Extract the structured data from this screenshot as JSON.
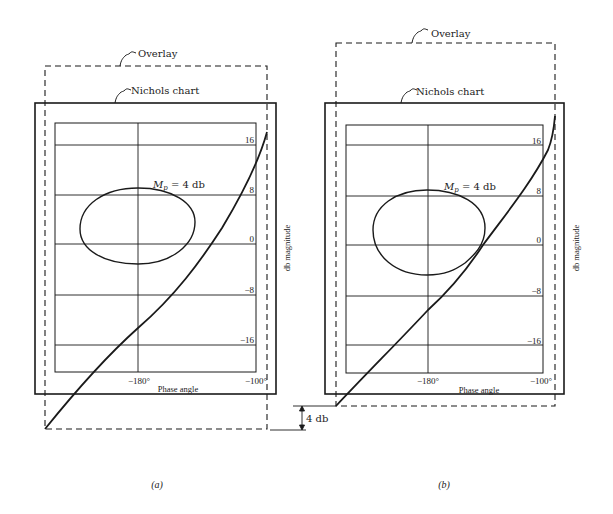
{
  "figure": {
    "panels": [
      {
        "id": "a",
        "caption": "(a)",
        "overlay_label": "Overlay",
        "nichols_label": "Nichols chart",
        "mp_label_main": "M",
        "mp_label_sub": "p",
        "mp_label_rest": " = 4 db",
        "y_ticks": [
          "16",
          "8",
          "0",
          "−8",
          "−16"
        ],
        "x_ticks": [
          "−180°",
          "−100°"
        ],
        "x_axis_label": "Phase angle",
        "y_axis_label": "db magnitude"
      },
      {
        "id": "b",
        "caption": "(b)",
        "overlay_label": "Overlay",
        "nichols_label": "Nichols chart",
        "mp_label_main": "M",
        "mp_label_sub": "p",
        "mp_label_rest": " = 4 db",
        "y_ticks": [
          "16",
          "8",
          "0",
          "−8",
          "−16"
        ],
        "x_ticks": [
          "−180°",
          "−100°"
        ],
        "x_axis_label": "Phase angle",
        "y_axis_label": "db magnitude"
      }
    ],
    "shift_annotation": "4 db",
    "colors": {
      "ink": "#1a1a1a",
      "background": "#ffffff"
    }
  }
}
